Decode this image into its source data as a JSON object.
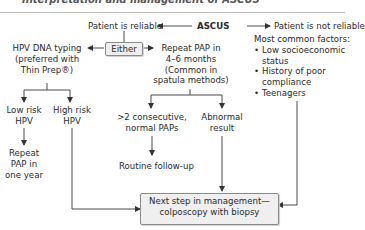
{
  "header": {
    "title": "Interpretation and management of ASCUS"
  },
  "diagram": {
    "root": "ASCUS",
    "left_branch": "Patient is reliable",
    "right_branch": "Patient is not reliable",
    "right_factors_title": "Most common factors:",
    "right_factors": [
      "Low socioeconomic status",
      "History of poor compliance",
      "Teenagers"
    ],
    "either_label": "Either",
    "hpv_option": [
      "HPV DNA typing",
      "(preferred with",
      "Thin Prep®)"
    ],
    "repeat_pap_option": [
      "Repeat PAP in",
      "4–6 months",
      "(Common in",
      "spatula methods)"
    ],
    "low_risk": [
      "Low risk",
      "HPV"
    ],
    "high_risk": [
      "High risk",
      "HPV"
    ],
    "repeat_year": [
      "Repeat",
      "PAP in",
      "one year"
    ],
    "normal_paps": [
      ">2 consecutive,",
      "normal PAPs"
    ],
    "abnormal": [
      "Abnormal",
      "result"
    ],
    "routine": "Routine follow-up",
    "next_step": [
      "Next step in management—",
      "colposcopy with biopsy"
    ]
  },
  "colors": {
    "line": "#4a4a4a",
    "box_fill": "#efefef",
    "box_border": "#8a8a8a"
  }
}
